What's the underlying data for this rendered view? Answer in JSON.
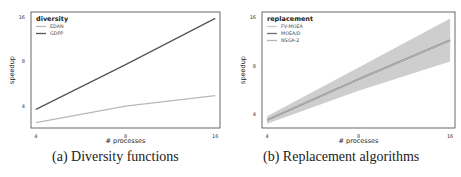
{
  "chart_data": [
    {
      "type": "line",
      "title": "",
      "caption": "(a) Diversity functions",
      "xlabel": "# processes",
      "ylabel": "speedup",
      "x": [
        4,
        8,
        16
      ],
      "xticks": [
        "4",
        "8",
        "16"
      ],
      "yticks": [
        "4",
        "8",
        "16"
      ],
      "xscale": "log2",
      "yscale": "log2",
      "xlim": [
        3.85,
        16.6
      ],
      "ylim": [
        2.85,
        17.2
      ],
      "grid": false,
      "legend": {
        "title": "diversity",
        "position": "upper left"
      },
      "series": [
        {
          "name": "EDAN",
          "values": [
            3.1,
            4.0,
            4.7
          ],
          "color": "#b9b9b9"
        },
        {
          "name": "GDPP",
          "values": [
            3.8,
            7.6,
            15.6
          ],
          "color": "#555555"
        }
      ]
    },
    {
      "type": "line",
      "title": "",
      "caption": "(b) Replacement algorithms",
      "xlabel": "# processes",
      "ylabel": "speedup",
      "x": [
        4,
        8,
        16
      ],
      "xticks": [
        "4",
        "8",
        "16"
      ],
      "yticks": [
        "4",
        "8",
        "16"
      ],
      "xscale": "log2",
      "yscale": "log2",
      "xlim": [
        3.85,
        16.6
      ],
      "ylim": [
        3.3,
        17.2
      ],
      "grid": false,
      "legend": {
        "title": "replacement",
        "position": "upper left"
      },
      "series": [
        {
          "name": "FV-MOEA",
          "values": [
            3.7,
            6.6,
            11.5
          ],
          "color": "#c8c8c8"
        },
        {
          "name": "MOEA/D",
          "values": [
            3.7,
            6.6,
            11.5
          ],
          "color": "#6a6a6a",
          "band_low": [
            3.5,
            5.6,
            8.5
          ],
          "band_high": [
            3.9,
            7.8,
            15.7
          ]
        },
        {
          "name": "NSGA-2",
          "values": [
            3.7,
            6.6,
            11.5
          ],
          "color": "#b5b5b5"
        }
      ]
    }
  ],
  "captions": {
    "left": "(a) Diversity functions",
    "right": "(b) Replacement algorithms"
  }
}
